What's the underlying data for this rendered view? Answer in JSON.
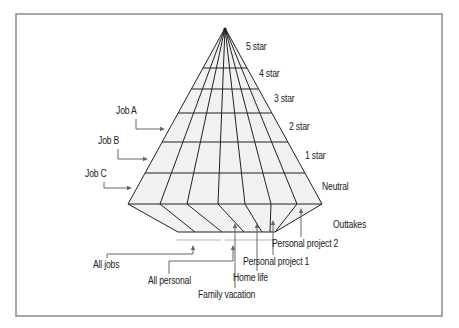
{
  "colors": {
    "frame": "#8a8a8a",
    "grid_line": "#222222",
    "fill": "#f1f1f1",
    "leader": "#666666",
    "bracket": "#b5b5b5",
    "text": "#222222"
  },
  "geometry": {
    "frame": {
      "x": 16,
      "y": 14,
      "w": 426,
      "h": 302
    },
    "apex": [
      225,
      28
    ],
    "row_y": [
      68,
      89,
      113,
      142,
      173,
      204
    ],
    "base_x": [
      128,
      160,
      187,
      218,
      245,
      271,
      297,
      322
    ],
    "bottom_y": 232,
    "bottom_x": [
      178,
      195,
      222,
      244,
      262,
      270,
      275,
      275
    ],
    "brackets": [
      {
        "x1": 176,
        "x2": 221,
        "y": 240
      },
      {
        "x1": 225,
        "x2": 275,
        "y": 240
      }
    ]
  },
  "levels": [
    {
      "label": "5 star",
      "x": 246,
      "y": 42
    },
    {
      "label": "4 star",
      "x": 259,
      "y": 69
    },
    {
      "label": "3 star",
      "x": 274,
      "y": 94
    },
    {
      "label": "2 star",
      "x": 289,
      "y": 122
    },
    {
      "label": "1 star",
      "x": 305,
      "y": 151
    },
    {
      "label": "Neutral",
      "x": 322,
      "y": 182
    },
    {
      "label": "Outtakes",
      "x": 333,
      "y": 220
    }
  ],
  "jobs": [
    {
      "label": "Job A",
      "x": 116,
      "y": 106,
      "path": "M136,119 V129 H162",
      "arrow": [
        165,
        129,
        "right"
      ]
    },
    {
      "label": "Job B",
      "x": 98,
      "y": 136,
      "path": "M118,149 V159 H145",
      "arrow": [
        148,
        159,
        "right"
      ]
    },
    {
      "label": "Job C",
      "x": 85,
      "y": 169,
      "path": "M104,182 V188 H129",
      "arrow": [
        132,
        188,
        "right"
      ]
    }
  ],
  "groups": [
    {
      "label": "All jobs",
      "x": 93,
      "y": 260,
      "path": "M107,258 V254 H193 V248",
      "arrow": [
        193,
        245,
        "up"
      ]
    },
    {
      "label": "All personal",
      "x": 148,
      "y": 276,
      "path": "M169,274 V261 H233 V248",
      "arrow": [
        233,
        245,
        "up"
      ]
    }
  ],
  "categories": [
    {
      "label": "Family vacation",
      "x": 198,
      "y": 290,
      "path": "M235,288 V226",
      "arrow": [
        235,
        223,
        "up"
      ]
    },
    {
      "label": "Home life",
      "x": 233,
      "y": 273,
      "path": "M257,271 V226",
      "arrow": [
        257,
        223,
        "up"
      ]
    },
    {
      "label": "Personal project 1",
      "x": 243,
      "y": 257,
      "path": "M273,255 V223",
      "arrow": [
        273,
        220,
        "up"
      ]
    },
    {
      "label": "Personal project 2",
      "x": 272,
      "y": 239,
      "path": "M301,237 V211",
      "arrow": [
        301,
        208,
        "up"
      ]
    }
  ]
}
